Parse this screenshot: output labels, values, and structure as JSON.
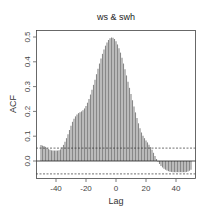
{
  "chart_data": {
    "type": "bar",
    "title": "ws & swh",
    "xlabel": "Lag",
    "ylabel": "ACF",
    "xlim": [
      -50,
      50
    ],
    "ylim": [
      -0.07,
      0.5
    ],
    "x_ticks": [
      -40,
      -20,
      0,
      20,
      40
    ],
    "x_tick_labels": [
      "-40",
      "-20",
      "0",
      "20",
      "40"
    ],
    "y_ticks": [
      0.0,
      0.1,
      0.2,
      0.3,
      0.4,
      0.5
    ],
    "y_tick_labels": [
      "0.0",
      "0.1",
      "0.2",
      "0.3",
      "0.4",
      "0.5"
    ],
    "confidence_bounds": [
      0.052,
      -0.052
    ],
    "zero_line": true,
    "grid": false,
    "legend": null,
    "bar_color": "#888888",
    "x": [
      -50,
      -49,
      -48,
      -47,
      -46,
      -45,
      -44,
      -43,
      -42,
      -41,
      -40,
      -39,
      -38,
      -37,
      -36,
      -35,
      -34,
      -33,
      -32,
      -31,
      -30,
      -29,
      -28,
      -27,
      -26,
      -25,
      -24,
      -23,
      -22,
      -21,
      -20,
      -19,
      -18,
      -17,
      -16,
      -15,
      -14,
      -13,
      -12,
      -11,
      -10,
      -9,
      -8,
      -7,
      -6,
      -5,
      -4,
      -3,
      -2,
      -1,
      0,
      1,
      2,
      3,
      4,
      5,
      6,
      7,
      8,
      9,
      10,
      11,
      12,
      13,
      14,
      15,
      16,
      17,
      18,
      19,
      20,
      21,
      22,
      23,
      24,
      25,
      26,
      27,
      28,
      29,
      30,
      31,
      32,
      33,
      34,
      35,
      36,
      37,
      38,
      39,
      40,
      41,
      42,
      43,
      44,
      45,
      46,
      47,
      48,
      49,
      50
    ],
    "values": [
      0.065,
      0.062,
      0.06,
      0.057,
      0.052,
      0.048,
      0.045,
      0.043,
      0.042,
      0.042,
      0.042,
      0.042,
      0.043,
      0.047,
      0.055,
      0.065,
      0.078,
      0.092,
      0.108,
      0.125,
      0.142,
      0.158,
      0.17,
      0.18,
      0.188,
      0.193,
      0.197,
      0.2,
      0.205,
      0.212,
      0.222,
      0.235,
      0.25,
      0.268,
      0.287,
      0.307,
      0.328,
      0.35,
      0.372,
      0.393,
      0.413,
      0.432,
      0.45,
      0.465,
      0.478,
      0.488,
      0.495,
      0.498,
      0.497,
      0.492,
      0.483,
      0.47,
      0.455,
      0.437,
      0.416,
      0.393,
      0.37,
      0.345,
      0.32,
      0.295,
      0.27,
      0.245,
      0.22,
      0.196,
      0.173,
      0.152,
      0.132,
      0.115,
      0.102,
      0.092,
      0.083,
      0.075,
      0.066,
      0.056,
      0.045,
      0.033,
      0.02,
      0.008,
      -0.003,
      -0.012,
      -0.02,
      -0.026,
      -0.031,
      -0.035,
      -0.038,
      -0.041,
      -0.043,
      -0.044,
      -0.045,
      -0.045,
      -0.045,
      -0.045,
      -0.045,
      -0.045,
      -0.045,
      -0.045,
      -0.045,
      -0.044,
      -0.042,
      -0.039,
      -0.035
    ]
  }
}
